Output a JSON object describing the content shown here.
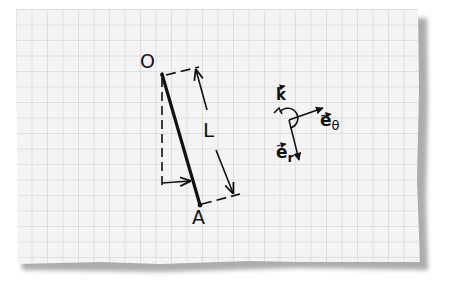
{
  "diagram": {
    "type": "physics-sketch-on-graph-paper",
    "labels": {
      "pivot": "O",
      "end": "A",
      "length": "L",
      "k_vector": "k",
      "e_theta_base": "e",
      "e_theta_sub": "θ",
      "e_r_base": "e",
      "e_r_sub": "r"
    },
    "colors": {
      "paper": "#f3f3f3",
      "grid": "#c9c9c9",
      "ink": "#111111",
      "shadow": "#9a9a9a"
    }
  }
}
